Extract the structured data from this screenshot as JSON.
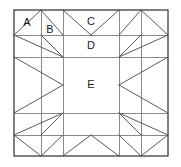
{
  "diagram": {
    "type": "quilt-block-pattern",
    "frame": {
      "x": 14,
      "y": 10,
      "width": 154,
      "height": 146,
      "border_color": "#4a4a4a",
      "border_width": 1.4
    },
    "grid": {
      "color": "#8a8a8a",
      "width": 1,
      "x_lines": [
        41,
        63,
        119,
        141
      ],
      "y_lines": [
        35,
        57,
        113,
        135
      ]
    },
    "diagonals": {
      "color": "#5a5a5a",
      "width": 1
    },
    "labels": [
      {
        "name": "A",
        "text": "A",
        "x": 27,
        "y": 23
      },
      {
        "name": "B",
        "text": "B",
        "x": 50,
        "y": 30
      },
      {
        "name": "C",
        "text": "C",
        "x": 91,
        "y": 22
      },
      {
        "name": "D",
        "text": "D",
        "x": 91,
        "y": 46
      },
      {
        "name": "E",
        "text": "E",
        "x": 91,
        "y": 85
      }
    ],
    "regions": [
      {
        "key": "A",
        "description": "corner plain square, top-left"
      },
      {
        "key": "B",
        "description": "half-square triangle beside corner"
      },
      {
        "key": "C",
        "description": "center top flying-geese unit"
      },
      {
        "key": "D",
        "description": "top inner border rectangle"
      },
      {
        "key": "E",
        "description": "center square"
      }
    ],
    "colors": {
      "background": "#ffffff",
      "outline": "#4a4a4a",
      "grid": "#8a8a8a",
      "diagonal": "#5a5a5a",
      "text": "#1a1a1a"
    }
  }
}
